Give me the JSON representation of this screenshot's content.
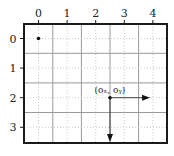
{
  "diagram": {
    "x_ticks": [
      "0",
      "1",
      "2",
      "3",
      "4"
    ],
    "y_ticks": [
      "0",
      "1",
      "2",
      "3"
    ],
    "origin_point": {
      "x": 0,
      "y": 0
    },
    "point": {
      "x": 2.5,
      "y": 2,
      "label": "(oₓ, oᵧ)"
    },
    "arrow_right_to": {
      "x": 3.9,
      "y": 2
    },
    "arrow_down_to": {
      "x": 2.5,
      "y": 3.5
    },
    "colors": {
      "frame": "#1a1a1a",
      "grid_solid": "#9a9a9a",
      "grid_dotted": "#bbbbbb",
      "mark": "#111111"
    }
  }
}
